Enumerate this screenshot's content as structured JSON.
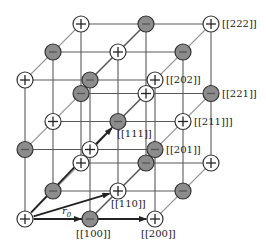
{
  "diagram": {
    "type": "ionic-crystal-lattice",
    "lattice_size": 3,
    "origin_px": [
      25,
      219
    ],
    "basis_px": {
      "x": [
        65,
        0
      ],
      "y": [
        28,
        -28
      ],
      "z": [
        0,
        -69.5
      ]
    },
    "node_radius": 8,
    "charge_rule": "positive when i+j+k is even",
    "colors": {
      "line": "#5a5a5a",
      "line_light": "#9a9a9a",
      "positive_fill": "#ffffff",
      "negative_fill": "#8c8c8c",
      "node_stroke": "#333333",
      "arrow": "#222222"
    },
    "symbols": {
      "positive": "+",
      "negative": "−"
    },
    "labels": [
      {
        "text": "[[222]]",
        "node": [
          2,
          2,
          2
        ],
        "dx": 11,
        "dy": -5
      },
      {
        "text": "[[202]]",
        "node": [
          2,
          0,
          2
        ],
        "dx": 11,
        "dy": -5
      },
      {
        "text": "[[221]]",
        "node": [
          2,
          2,
          1
        ],
        "dx": 11,
        "dy": -5
      },
      {
        "text": "[[211]]]",
        "node": [
          2,
          1,
          1
        ],
        "dx": 11,
        "dy": -5
      },
      {
        "text": "[[111]]",
        "node": [
          1,
          1,
          1
        ],
        "dx": -1,
        "dy": 7
      },
      {
        "text": "[[201]]",
        "node": [
          2,
          0,
          1
        ],
        "dx": 11,
        "dy": -5
      },
      {
        "text": "[[110]]",
        "node": [
          1,
          1,
          0
        ],
        "dx": -7,
        "dy": 8
      },
      {
        "text": "[[100]]",
        "node": [
          1,
          0,
          0
        ],
        "dx": -14,
        "dy": 10
      },
      {
        "text": "[[200]]",
        "node": [
          2,
          0,
          0
        ],
        "dx": -14,
        "dy": 10
      }
    ],
    "arrows": [
      {
        "from": [
          0,
          0,
          0
        ],
        "to": [
          1,
          0,
          0
        ],
        "name": "r0-vector"
      },
      {
        "from": [
          0,
          0,
          0
        ],
        "to": [
          2,
          0,
          0
        ],
        "name": "vector-200"
      },
      {
        "from": [
          0,
          0,
          0
        ],
        "to": [
          1,
          1,
          0
        ],
        "name": "vector-110"
      },
      {
        "from": [
          0,
          0,
          0
        ],
        "to": [
          1,
          1,
          1
        ],
        "name": "vector-111"
      }
    ],
    "r0_label": {
      "main": "r",
      "sub": "0",
      "x": 62,
      "y": 206
    }
  }
}
